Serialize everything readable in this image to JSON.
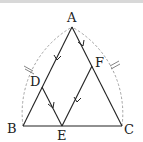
{
  "diagram": {
    "title": "",
    "points": {
      "A": {
        "label": "A"
      },
      "B": {
        "label": "B"
      },
      "C": {
        "label": "C"
      },
      "D": {
        "label": "D"
      },
      "E": {
        "label": "E"
      },
      "F": {
        "label": "F"
      }
    },
    "segments": [
      {
        "from": "A",
        "to": "B"
      },
      {
        "from": "A",
        "to": "C"
      },
      {
        "from": "B",
        "to": "C"
      },
      {
        "from": "D",
        "to": "E"
      },
      {
        "from": "E",
        "to": "F"
      }
    ],
    "parallel_marks": [
      {
        "segment": "AD",
        "marker": "single-arrow"
      },
      {
        "segment": "FE",
        "marker": "single-arrow"
      },
      {
        "segment": "AF",
        "marker": "single-arrow"
      },
      {
        "segment": "DE",
        "marker": "single-arrow"
      }
    ],
    "arcs": [
      {
        "center": "C",
        "from": "B",
        "to": "A",
        "style": "dashed",
        "equal_mark": "double-tick"
      },
      {
        "center": "B",
        "from": "C",
        "to": "A",
        "style": "dashed",
        "equal_mark": "double-tick"
      }
    ],
    "colors": {
      "line": "#222222",
      "arc": "#999999"
    }
  }
}
